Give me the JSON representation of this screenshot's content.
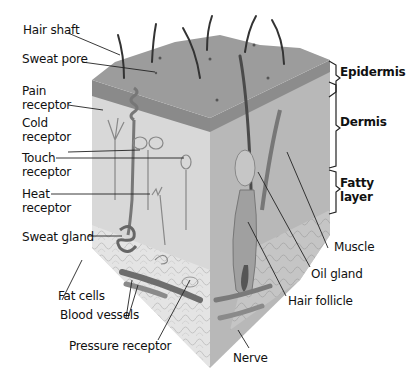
{
  "labels_left": {
    "hair_shaft": "Hair shaft",
    "sweat_pore": "Sweat pore",
    "pain_receptor_1": "Pain",
    "pain_receptor_2": "receptor",
    "cold_receptor_1": "Cold",
    "cold_receptor_2": "receptor",
    "touch_receptor_1": "Touch",
    "touch_receptor_2": "receptor",
    "heat_receptor_1": "Heat",
    "heat_receptor_2": "receptor",
    "sweat_gland": "Sweat gland",
    "fat_cells": "Fat cells",
    "blood_vessels": "Blood vessels",
    "pressure_receptor": "Pressure receptor"
  },
  "labels_right": {
    "muscle": "Muscle",
    "oil_gland": "Oil gland",
    "hair_follicle": "Hair follicle",
    "nerve": "Nerve"
  },
  "layers": {
    "epidermis": "Epidermis",
    "dermis": "Dermis",
    "fatty_layer_1": "Fatty",
    "fatty_layer_2": "layer"
  },
  "colors": {
    "surface": "#9a9a9a",
    "epidermis_band": "#8a8a8a",
    "dermis_front": "#d9d9d9",
    "right_face": "#b9b9b9",
    "fat": "#e6e6e6",
    "lines": "#222222"
  }
}
